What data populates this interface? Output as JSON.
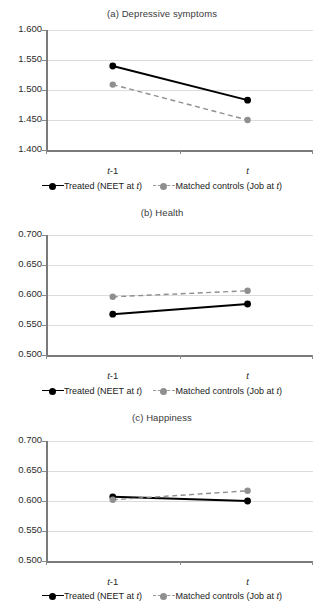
{
  "figure": {
    "panel_count": 3,
    "colors": {
      "treated_line": "#000000",
      "control_line": "#8f8f8f",
      "gridline": "#dcdcdc",
      "axis": "#7a7a7a"
    }
  },
  "legend": {
    "treated": {
      "prefix": "Treated (NEET at ",
      "italic": "t",
      "suffix": ")"
    },
    "control": {
      "prefix": "Matched controls (Job at ",
      "italic": "t",
      "suffix": ")"
    }
  },
  "xaxis": {
    "tick1_italic": "t",
    "tick1_plain": "-1",
    "tick2_italic": "t",
    "tick2_plain": ""
  },
  "chart_data": [
    {
      "type": "line",
      "title": "(a) Depressive symptoms",
      "x": [
        "t-1",
        "t"
      ],
      "xlabel": "",
      "ylabel": "",
      "ylim": [
        1.4,
        1.6
      ],
      "yticks": [
        "1.600",
        "1.550",
        "1.500",
        "1.450",
        "1.400"
      ],
      "ytick_values": [
        1.6,
        1.55,
        1.5,
        1.45,
        1.4
      ],
      "grid": true,
      "legend_position": "bottom",
      "series": [
        {
          "name": "Treated (NEET at t)",
          "values": [
            1.54,
            1.483
          ],
          "style": "solid",
          "color": "#000000"
        },
        {
          "name": "Matched controls (Job at t)",
          "values": [
            1.509,
            1.45
          ],
          "style": "dashed",
          "color": "#8f8f8f"
        }
      ]
    },
    {
      "type": "line",
      "title": "(b) Health",
      "x": [
        "t-1",
        "t"
      ],
      "xlabel": "",
      "ylabel": "",
      "ylim": [
        0.5,
        0.7
      ],
      "yticks": [
        "0.700",
        "0.650",
        "0.600",
        "0.550",
        "0.500"
      ],
      "ytick_values": [
        0.7,
        0.65,
        0.6,
        0.55,
        0.5
      ],
      "grid": true,
      "legend_position": "bottom",
      "series": [
        {
          "name": "Treated (NEET at t)",
          "values": [
            0.568,
            0.585
          ],
          "style": "solid",
          "color": "#000000"
        },
        {
          "name": "Matched controls (Job at t)",
          "values": [
            0.597,
            0.607
          ],
          "style": "dashed",
          "color": "#8f8f8f"
        }
      ]
    },
    {
      "type": "line",
      "title": "(c) Happiness",
      "x": [
        "t-1",
        "t"
      ],
      "xlabel": "",
      "ylabel": "",
      "ylim": [
        0.5,
        0.7
      ],
      "yticks": [
        "0.700",
        "0.650",
        "0.600",
        "0.550",
        "0.500"
      ],
      "ytick_values": [
        0.7,
        0.65,
        0.6,
        0.55,
        0.5
      ],
      "grid": true,
      "legend_position": "bottom",
      "series": [
        {
          "name": "Treated (NEET at t)",
          "values": [
            0.607,
            0.6
          ],
          "style": "solid",
          "color": "#000000"
        },
        {
          "name": "Matched controls (Job at t)",
          "values": [
            0.602,
            0.617
          ],
          "style": "dashed",
          "color": "#8f8f8f"
        }
      ]
    }
  ]
}
